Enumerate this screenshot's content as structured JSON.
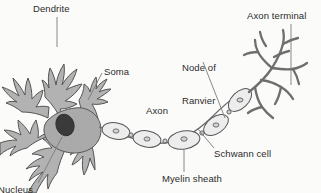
{
  "figure": {
    "background_color": "#fbfbfa",
    "line_color": "#4a4a4a",
    "cell_fill_color": "#b0b0b0",
    "myelin_fill_color": "#e8e8e8",
    "nucleus_color": "#3a3a3a",
    "text_color": "#2b2b2b"
  },
  "labels": {
    "dendrite": "Dendrite",
    "axon_terminal": "Axon terminal",
    "node_of_ranvier_line1": "Node of",
    "node_of_ranvier_line2": "Ranvier",
    "soma": "Soma",
    "axon": "Axon",
    "schwann_cell": "Schwann cell",
    "myelin_sheath": "Myelin sheath",
    "nucleus": "Nucleus"
  }
}
